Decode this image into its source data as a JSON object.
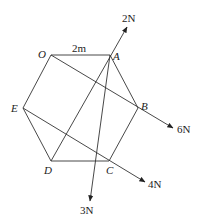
{
  "diagram": {
    "type": "regular hexagon with forces",
    "vertices": [
      {
        "id": "O",
        "label": "O",
        "x": 51,
        "y": 55,
        "lx": 38,
        "ly": 58
      },
      {
        "id": "A",
        "label": "A",
        "x": 110,
        "y": 55,
        "lx": 113,
        "ly": 60
      },
      {
        "id": "B",
        "label": "B",
        "x": 138,
        "y": 108,
        "lx": 141,
        "ly": 110
      },
      {
        "id": "C",
        "label": "C",
        "x": 109,
        "y": 161,
        "lx": 106,
        "ly": 174
      },
      {
        "id": "D",
        "label": "D",
        "x": 51,
        "y": 161,
        "lx": 44,
        "ly": 174
      },
      {
        "id": "E",
        "label": "E",
        "x": 23,
        "y": 108,
        "lx": 11,
        "ly": 112
      }
    ],
    "side_label": {
      "text": "2m",
      "x": 72,
      "y": 52
    },
    "forces": [
      {
        "name": "force-2N",
        "label": "2N",
        "from": "D",
        "x1": 51,
        "y1": 161,
        "x2": 127,
        "y2": 27,
        "lx": 122,
        "ly": 22
      },
      {
        "name": "force-6N",
        "label": "6N",
        "from": "O",
        "x1": 51,
        "y1": 55,
        "x2": 173,
        "y2": 128,
        "lx": 177,
        "ly": 133
      },
      {
        "name": "force-4N",
        "label": "4N",
        "from": "E",
        "x1": 23,
        "y1": 108,
        "x2": 145,
        "y2": 182,
        "lx": 148,
        "ly": 188
      },
      {
        "name": "force-3N",
        "label": "3N",
        "from": "A",
        "x1": 110,
        "y1": 55,
        "x2": 90,
        "y2": 201,
        "lx": 80,
        "ly": 214
      }
    ],
    "colors": {
      "line": "#333333",
      "text": "#222222"
    }
  }
}
